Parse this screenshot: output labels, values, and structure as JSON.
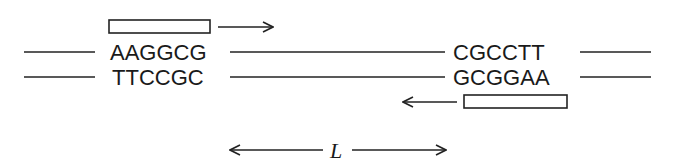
{
  "diagram": {
    "type": "dna-primer-binding",
    "strands": {
      "top": {
        "left_site": "AAGGCG",
        "right_site": "CGCCTT"
      },
      "bottom": {
        "left_site": "TTCCGC",
        "right_site": "GCGGAA"
      }
    },
    "primers": [
      {
        "position": "above-left",
        "direction": "right"
      },
      {
        "position": "below-right",
        "direction": "left"
      }
    ],
    "distance_label": "L",
    "colors": {
      "ink": "#1a1a1a",
      "background": "#ffffff"
    }
  }
}
